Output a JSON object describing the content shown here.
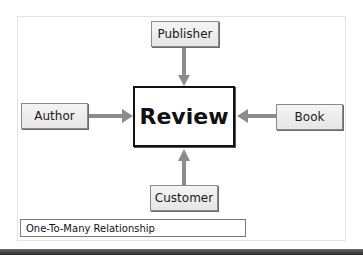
{
  "diagram": {
    "center": {
      "label": "Review"
    },
    "entities": [
      {
        "id": "publisher",
        "label": "Publisher",
        "position": "top"
      },
      {
        "id": "author",
        "label": "Author",
        "position": "left"
      },
      {
        "id": "book",
        "label": "Book",
        "position": "right"
      },
      {
        "id": "customer",
        "label": "Customer",
        "position": "bottom"
      }
    ],
    "relationships": [
      {
        "from": "Publisher",
        "to": "Review",
        "type": "one-to-many"
      },
      {
        "from": "Author",
        "to": "Review",
        "type": "one-to-many"
      },
      {
        "from": "Book",
        "to": "Review",
        "type": "one-to-many"
      },
      {
        "from": "Customer",
        "to": "Review",
        "type": "one-to-many"
      }
    ],
    "legend": {
      "label": "One-To-Many Relationship"
    },
    "colors": {
      "arrow": "#8c8c8c",
      "box_fill": "#ececec",
      "border": "#8a8a8a",
      "center_border": "#111111"
    }
  }
}
